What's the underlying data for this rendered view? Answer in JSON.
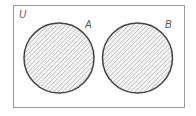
{
  "diagram": {
    "type": "venn",
    "universe_label": "U",
    "sets": [
      {
        "id": "A",
        "label": "A",
        "shaded": true
      },
      {
        "id": "B",
        "label": "B",
        "shaded": true
      }
    ],
    "relationship": "disjoint",
    "shaded_region": "A ∪ B",
    "colors": {
      "outline": "#444444",
      "frame": "#9a9a9a",
      "hatch": "#b8b8b8",
      "label": "#555555"
    }
  }
}
